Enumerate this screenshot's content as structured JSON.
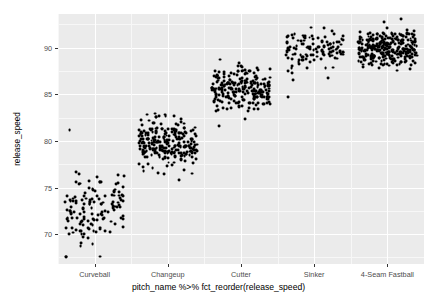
{
  "chart_data": {
    "type": "scatter",
    "title": "",
    "subtitle": "",
    "xlabel": "pitch_name %>% fct_reorder(release_speed)",
    "ylabel": "release_speed",
    "categories": [
      "Curveball",
      "Changeup",
      "Cutter",
      "Sinker",
      "4-Seam Fastball"
    ],
    "ytick_labels": [
      "70",
      "75",
      "80",
      "85",
      "90"
    ],
    "ytick_values": [
      70,
      75,
      80,
      85,
      90
    ],
    "ylim": [
      66.8,
      93.6
    ],
    "y_minor_ticks": [
      67.5,
      72.5,
      77.5,
      82.5,
      87.5,
      92.5
    ],
    "grid": true,
    "grid_color": "#ffffff",
    "panel_background": "#ebebeb",
    "point_color": "#000000",
    "point_size": 2.9,
    "legend": "none",
    "jitter": true,
    "series": [
      {
        "name": "Curveball",
        "category_index": 0,
        "n": 138,
        "y_mean": 72.4,
        "y_sd": 1.9,
        "y_min": 67.3,
        "y_max": 81.2,
        "outliers": [
          81.2,
          76.3
        ]
      },
      {
        "name": "Changeup",
        "category_index": 1,
        "n": 252,
        "y_mean": 79.7,
        "y_sd": 1.2,
        "y_min": 75.8,
        "y_max": 83.1,
        "outliers": [
          75.8
        ]
      },
      {
        "name": "Cutter",
        "category_index": 2,
        "n": 236,
        "y_mean": 85.6,
        "y_sd": 1.1,
        "y_min": 81.6,
        "y_max": 89.0,
        "outliers": [
          81.6,
          82.3
        ]
      },
      {
        "name": "Sinker",
        "category_index": 3,
        "n": 118,
        "y_mean": 89.6,
        "y_sd": 1.1,
        "y_min": 84.7,
        "y_max": 92.5,
        "outliers": [
          84.7,
          86.5
        ]
      },
      {
        "name": "4-Seam Fastball",
        "category_index": 4,
        "n": 300,
        "y_mean": 89.8,
        "y_sd": 1.0,
        "y_min": 86.3,
        "y_max": 93.1,
        "outliers": [
          93.1
        ]
      }
    ]
  }
}
